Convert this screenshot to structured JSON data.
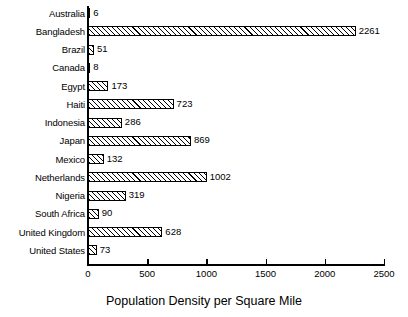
{
  "chart_data": {
    "type": "bar",
    "orientation": "horizontal",
    "title": "",
    "xlabel": "Population Density per Square Mile",
    "ylabel": "",
    "xlim": [
      0,
      2500
    ],
    "xticks": [
      0,
      500,
      1000,
      1500,
      2000,
      2500
    ],
    "xtick_labels": [
      "0",
      "500",
      "1000",
      "1500",
      "2000",
      "2500"
    ],
    "grid": false,
    "legend": false,
    "bar_style": {
      "fill": "diagonal-hatch",
      "edge_color": "#000000",
      "face_color": "#ffffff"
    },
    "categories": [
      "Australia",
      "Bangladesh",
      "Brazil",
      "Canada",
      "Egypt",
      "Haiti",
      "Indonesia",
      "Japan",
      "Mexico",
      "Netherlands",
      "Nigeria",
      "South Africa",
      "United Kingdom",
      "United States"
    ],
    "values": [
      6,
      2261,
      51,
      8,
      173,
      723,
      286,
      869,
      132,
      1002,
      319,
      90,
      628,
      73
    ],
    "value_labels": [
      "6",
      "2261",
      "51",
      "8",
      "173",
      "723",
      "286",
      "869",
      "132",
      "1002",
      "319",
      "90",
      "628",
      "73"
    ]
  }
}
